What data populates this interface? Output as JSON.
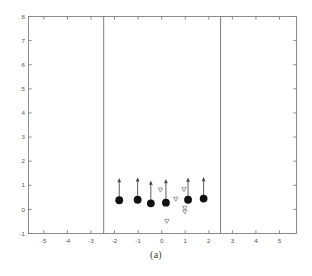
{
  "figure": {
    "caption": "(a)",
    "background_color": "#ffffff",
    "frame_color": "#808080",
    "marker_color": "#111111",
    "arrow_color": "#4a4a4a",
    "triangle_color": "#8a8a8a"
  },
  "chart_data": {
    "type": "scatter",
    "title": "",
    "subtitle": "",
    "xlabel": "",
    "ylabel": "",
    "xlim": [
      -5.65,
      5.72
    ],
    "ylim": [
      -1,
      8
    ],
    "xticks": [
      -5,
      -4,
      -3,
      -2,
      -1,
      0,
      1,
      2,
      3,
      4,
      5
    ],
    "xtick_labels": [
      "-5",
      "-4",
      "-3",
      "-2",
      "-1",
      "0",
      "1",
      "2",
      "3",
      "4",
      "5"
    ],
    "yticks": [
      -1,
      0,
      1,
      2,
      3,
      4,
      5,
      6,
      7,
      8
    ],
    "ytick_labels": [
      "-1",
      "0",
      "1",
      "2",
      "3",
      "4",
      "5",
      "6",
      "7",
      "8"
    ],
    "grid": false,
    "legend": null,
    "legend_position": "none",
    "series": [
      {
        "name": "agents",
        "marker": "filled-circle",
        "color": "#111111",
        "points": [
          {
            "x": -1.8,
            "y": 0.38
          },
          {
            "x": -1.02,
            "y": 0.4
          },
          {
            "x": -0.46,
            "y": 0.25
          },
          {
            "x": 0.18,
            "y": 0.28
          },
          {
            "x": 1.12,
            "y": 0.4
          },
          {
            "x": 1.78,
            "y": 0.45
          }
        ]
      },
      {
        "name": "velocity-arrows",
        "marker": "arrow-up",
        "color": "#4a4a4a",
        "arrows": [
          {
            "x": -1.8,
            "y0": 0.38,
            "y1": 1.3
          },
          {
            "x": -1.02,
            "y0": 0.4,
            "y1": 1.33
          },
          {
            "x": -0.46,
            "y0": 0.25,
            "y1": 1.2
          },
          {
            "x": 0.18,
            "y0": 0.28,
            "y1": 1.26
          },
          {
            "x": 1.12,
            "y0": 0.4,
            "y1": 1.32
          },
          {
            "x": 1.78,
            "y0": 0.45,
            "y1": 1.34
          }
        ]
      },
      {
        "name": "targets",
        "marker": "open-down-triangle",
        "color": "#8a8a8a",
        "points": [
          {
            "x": -0.05,
            "y": 0.8
          },
          {
            "x": 0.6,
            "y": 0.42
          },
          {
            "x": 0.95,
            "y": 0.82
          },
          {
            "x": 0.98,
            "y": 0.05
          },
          {
            "x": 0.98,
            "y": -0.1
          },
          {
            "x": 0.22,
            "y": -0.5
          }
        ]
      }
    ],
    "reference_lines": [
      {
        "orientation": "vertical",
        "x": -2.46,
        "color": "#6e6e6e"
      },
      {
        "orientation": "vertical",
        "x": 2.5,
        "color": "#6e6e6e"
      }
    ],
    "annotations": []
  }
}
